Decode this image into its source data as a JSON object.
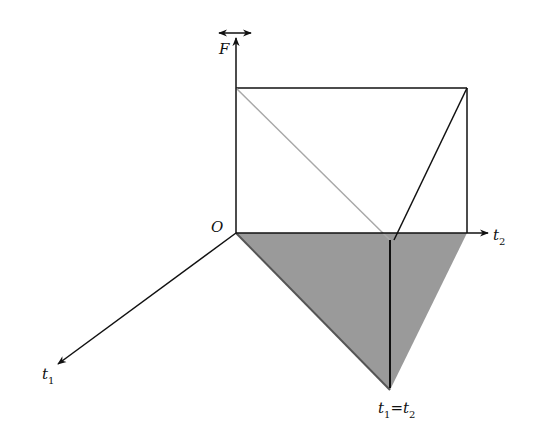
{
  "diagram": {
    "type": "3d-axes-region",
    "colors": {
      "axis": "#111111",
      "shaded_region": "#9a9a9a",
      "shaded_edge": "#555555",
      "diagonal": "#a8a8a8",
      "background": "#ffffff"
    },
    "labels": {
      "origin": "O",
      "f_axis": "F",
      "f_axis_mark": "double-arrow",
      "t1_axis": "t",
      "t1_sub": "1",
      "t2_axis": "t",
      "t2_sub": "2",
      "diag_t1": "t",
      "diag_t1_sub": "1",
      "diag_eq": "=",
      "diag_t2": "t",
      "diag_t2_sub": "2"
    }
  }
}
